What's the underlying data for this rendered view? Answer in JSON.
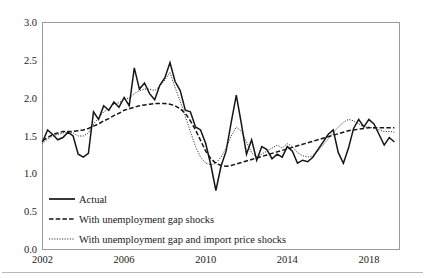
{
  "chart_data": {
    "type": "line",
    "title": "",
    "subtitle": "",
    "xlabel": "",
    "ylabel": "",
    "xlim": [
      2002.0,
      2019.5
    ],
    "ylim": [
      0.0,
      3.0
    ],
    "grid": false,
    "legend_position": "inside-bottom-left",
    "y_ticks": [
      "0.0",
      "0.5",
      "1.0",
      "1.5",
      "2.0",
      "2.5",
      "3.0"
    ],
    "y_tick_values": [
      0.0,
      0.5,
      1.0,
      1.5,
      2.0,
      2.5,
      3.0
    ],
    "x_ticks": [
      "2002",
      "2006",
      "2010",
      "2014",
      "2018"
    ],
    "x_tick_values": [
      2002,
      2006,
      2010,
      2014,
      2018
    ],
    "x": [
      2002.0,
      2002.25,
      2002.5,
      2002.75,
      2003.0,
      2003.25,
      2003.5,
      2003.75,
      2004.0,
      2004.25,
      2004.5,
      2004.75,
      2005.0,
      2005.25,
      2005.5,
      2005.75,
      2006.0,
      2006.25,
      2006.5,
      2006.75,
      2007.0,
      2007.25,
      2007.5,
      2007.75,
      2008.0,
      2008.25,
      2008.5,
      2008.75,
      2009.0,
      2009.25,
      2009.5,
      2009.75,
      2010.0,
      2010.25,
      2010.5,
      2010.75,
      2011.0,
      2011.25,
      2011.5,
      2011.75,
      2012.0,
      2012.25,
      2012.5,
      2012.75,
      2013.0,
      2013.25,
      2013.5,
      2013.75,
      2014.0,
      2014.25,
      2014.5,
      2014.75,
      2015.0,
      2015.25,
      2015.5,
      2015.75,
      2016.0,
      2016.25,
      2016.5,
      2016.75,
      2017.0,
      2017.25,
      2017.5,
      2017.75,
      2018.0,
      2018.25,
      2018.5,
      2018.75,
      2019.0,
      2019.25
    ],
    "series": [
      {
        "name": "Actual",
        "style": "solid",
        "values": [
          1.42,
          1.58,
          1.52,
          1.45,
          1.48,
          1.55,
          1.5,
          1.26,
          1.22,
          1.27,
          1.82,
          1.72,
          1.9,
          1.84,
          1.95,
          1.88,
          2.01,
          1.9,
          2.4,
          2.12,
          2.2,
          2.06,
          1.98,
          2.17,
          2.27,
          2.47,
          2.22,
          2.1,
          1.84,
          1.82,
          1.62,
          1.58,
          1.4,
          1.12,
          0.78,
          1.1,
          1.3,
          1.68,
          2.04,
          1.66,
          1.26,
          1.45,
          1.18,
          1.36,
          1.32,
          1.2,
          1.26,
          1.22,
          1.36,
          1.3,
          1.14,
          1.18,
          1.16,
          1.22,
          1.32,
          1.42,
          1.52,
          1.58,
          1.28,
          1.14,
          1.34,
          1.6,
          1.72,
          1.62,
          1.72,
          1.66,
          1.52,
          1.38,
          1.48,
          1.42
        ]
      },
      {
        "name": "With unemployment gap shocks",
        "style": "dashed",
        "values": [
          1.44,
          1.48,
          1.52,
          1.54,
          1.56,
          1.56,
          1.56,
          1.57,
          1.58,
          1.6,
          1.63,
          1.66,
          1.7,
          1.73,
          1.77,
          1.8,
          1.84,
          1.86,
          1.88,
          1.9,
          1.91,
          1.92,
          1.93,
          1.93,
          1.93,
          1.92,
          1.9,
          1.86,
          1.8,
          1.7,
          1.58,
          1.44,
          1.3,
          1.2,
          1.14,
          1.11,
          1.1,
          1.11,
          1.13,
          1.15,
          1.17,
          1.19,
          1.21,
          1.23,
          1.25,
          1.27,
          1.29,
          1.31,
          1.33,
          1.35,
          1.37,
          1.39,
          1.41,
          1.43,
          1.45,
          1.47,
          1.49,
          1.51,
          1.53,
          1.55,
          1.57,
          1.58,
          1.59,
          1.6,
          1.61,
          1.61,
          1.61,
          1.61,
          1.61,
          1.61
        ]
      },
      {
        "name": "With unemployment gap and import price shocks",
        "style": "dotted",
        "values": [
          1.4,
          1.46,
          1.5,
          1.52,
          1.54,
          1.55,
          1.54,
          1.5,
          1.5,
          1.54,
          1.66,
          1.74,
          1.82,
          1.86,
          1.92,
          1.94,
          1.98,
          2.0,
          2.06,
          2.1,
          2.12,
          2.12,
          2.1,
          2.16,
          2.24,
          2.34,
          2.14,
          1.96,
          1.76,
          1.56,
          1.36,
          1.22,
          1.14,
          1.12,
          1.14,
          1.22,
          1.34,
          1.5,
          1.62,
          1.56,
          1.42,
          1.28,
          1.22,
          1.26,
          1.3,
          1.34,
          1.38,
          1.34,
          1.4,
          1.36,
          1.28,
          1.24,
          1.22,
          1.24,
          1.3,
          1.38,
          1.46,
          1.54,
          1.62,
          1.68,
          1.72,
          1.7,
          1.66,
          1.62,
          1.62,
          1.6,
          1.58,
          1.56,
          1.56,
          1.55
        ]
      }
    ],
    "legend": [
      "Actual",
      "With unemployment gap shocks",
      "With unemployment gap and import price shocks"
    ]
  }
}
